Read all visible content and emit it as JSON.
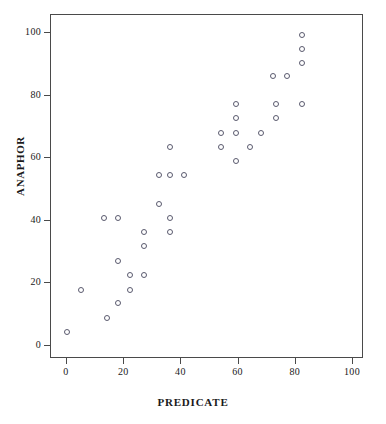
{
  "chart_data": {
    "type": "scatter",
    "title": "",
    "xlabel": "PREDICATE",
    "ylabel": "ANAPHOR",
    "xlim": [
      -5,
      107
    ],
    "ylim": [
      -5,
      105
    ],
    "xticks": [
      0,
      20,
      40,
      60,
      80,
      100
    ],
    "yticks": [
      0,
      20,
      40,
      60,
      80,
      100
    ],
    "grid": false,
    "legend": null,
    "marker": "open-circle",
    "marker_color": "#5a5a6e",
    "points": [
      {
        "x": 0,
        "y": 4.5
      },
      {
        "x": 5,
        "y": 18.0
      },
      {
        "x": 14,
        "y": 9.0
      },
      {
        "x": 13,
        "y": 41.0
      },
      {
        "x": 18,
        "y": 41.0
      },
      {
        "x": 18,
        "y": 13.6
      },
      {
        "x": 18,
        "y": 27.3
      },
      {
        "x": 22,
        "y": 22.7
      },
      {
        "x": 22,
        "y": 18.0
      },
      {
        "x": 27,
        "y": 36.4
      },
      {
        "x": 27,
        "y": 31.8
      },
      {
        "x": 27,
        "y": 22.7
      },
      {
        "x": 32,
        "y": 45.5
      },
      {
        "x": 32,
        "y": 54.5
      },
      {
        "x": 36,
        "y": 63.6
      },
      {
        "x": 36,
        "y": 54.5
      },
      {
        "x": 36,
        "y": 40.9
      },
      {
        "x": 36,
        "y": 36.4
      },
      {
        "x": 41,
        "y": 54.5
      },
      {
        "x": 54,
        "y": 68.2
      },
      {
        "x": 54,
        "y": 63.6
      },
      {
        "x": 59,
        "y": 77.3
      },
      {
        "x": 59,
        "y": 72.7
      },
      {
        "x": 59,
        "y": 68.2
      },
      {
        "x": 59,
        "y": 59.1
      },
      {
        "x": 64,
        "y": 63.6
      },
      {
        "x": 68,
        "y": 68.2
      },
      {
        "x": 72,
        "y": 86.4
      },
      {
        "x": 73,
        "y": 77.3
      },
      {
        "x": 73,
        "y": 72.7
      },
      {
        "x": 77,
        "y": 86.4
      },
      {
        "x": 82,
        "y": 99.5
      },
      {
        "x": 82,
        "y": 95.0
      },
      {
        "x": 82,
        "y": 90.5
      },
      {
        "x": 82,
        "y": 77.3
      }
    ]
  },
  "axes": {
    "y_title": "ANAPHOR",
    "x_title": "PREDICATE",
    "y_tick_labels": [
      "100",
      "80",
      "60",
      "40",
      "20",
      "0"
    ],
    "x_tick_labels": [
      "0",
      "20",
      "40",
      "60",
      "80",
      "100"
    ]
  },
  "caption": ""
}
